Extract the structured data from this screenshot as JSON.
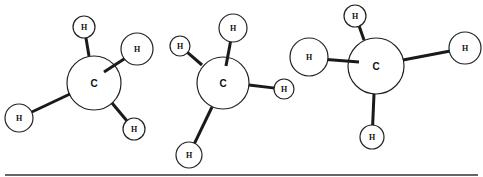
{
  "diagram": {
    "title": "",
    "molecules": [
      {
        "name": "methane-1",
        "center": {
          "label": "C",
          "x": 94,
          "y": 83,
          "r": 27
        },
        "hydrogens": [
          {
            "label": "H",
            "x": 84,
            "y": 27,
            "r": 11,
            "bond_from": [
              89,
              56
            ]
          },
          {
            "label": "H",
            "x": 137,
            "y": 49,
            "r": 16,
            "bond_from": [
              104,
              72
            ]
          },
          {
            "label": "H",
            "x": 19,
            "y": 118,
            "r": 14,
            "bond_from": [
              70,
              94
            ]
          },
          {
            "label": "H",
            "x": 134,
            "y": 129,
            "r": 11,
            "bond_from": [
              112,
              103
            ]
          }
        ]
      },
      {
        "name": "methane-2",
        "center": {
          "label": "C",
          "x": 223,
          "y": 83,
          "r": 26
        },
        "hydrogens": [
          {
            "label": "H",
            "x": 233,
            "y": 28,
            "r": 14,
            "bond_from": [
              226,
              66
            ]
          },
          {
            "label": "H",
            "x": 180,
            "y": 46,
            "r": 10,
            "bond_from": [
              202,
              65
            ]
          },
          {
            "label": "H",
            "x": 284,
            "y": 89,
            "r": 10,
            "bond_from": [
              249,
              85
            ]
          },
          {
            "label": "H",
            "x": 189,
            "y": 155,
            "r": 13,
            "bond_from": [
              212,
              107
            ]
          }
        ]
      },
      {
        "name": "methane-3",
        "center": {
          "label": "C",
          "x": 376,
          "y": 66,
          "r": 28
        },
        "hydrogens": [
          {
            "label": "H",
            "x": 355,
            "y": 16,
            "r": 11,
            "bond_from": [
              364,
              40
            ]
          },
          {
            "label": "H",
            "x": 309,
            "y": 57,
            "r": 19,
            "bond_from": [
              359,
              62
            ]
          },
          {
            "label": "H",
            "x": 465,
            "y": 48,
            "r": 16,
            "bond_from": [
              403,
              60
            ]
          },
          {
            "label": "H",
            "x": 372,
            "y": 137,
            "r": 12,
            "bond_from": [
              374,
              94
            ]
          }
        ]
      }
    ],
    "rule": {
      "x1": 5,
      "x2": 478,
      "y": 175
    }
  }
}
